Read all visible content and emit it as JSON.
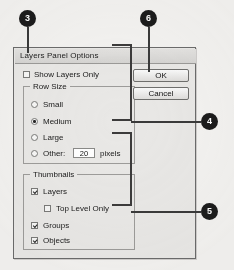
{
  "figure": {
    "type": "annotated-dialog-screenshot",
    "background_color": "#f3f2f0"
  },
  "dialog": {
    "title": "Layers Panel Options",
    "show_layers_only": {
      "label": "Show Layers Only",
      "checked": false
    },
    "row_size": {
      "group_title": "Row Size",
      "options": [
        {
          "label": "Small",
          "selected": false
        },
        {
          "label": "Medium",
          "selected": true
        },
        {
          "label": "Large",
          "selected": false
        },
        {
          "label": "Other:",
          "selected": false
        }
      ],
      "other_value": "20",
      "other_units": "pixels"
    },
    "thumbnails": {
      "group_title": "Thumbnails",
      "options": [
        {
          "label": "Layers",
          "checked": true
        },
        {
          "label": "Top Level Only",
          "checked": false
        },
        {
          "label": "Groups",
          "checked": true
        },
        {
          "label": "Objects",
          "checked": true
        }
      ]
    },
    "buttons": {
      "ok": "OK",
      "cancel": "Cancel"
    }
  },
  "callouts": [
    {
      "number": "3",
      "target": "show-layers-only-checkbox"
    },
    {
      "number": "6",
      "target": "ok-button"
    },
    {
      "number": "4",
      "target": "row-size-group"
    },
    {
      "number": "5",
      "target": "thumbnails-group"
    }
  ],
  "callout_labels": {
    "three": "3",
    "six": "6",
    "four": "4",
    "five": "5"
  }
}
